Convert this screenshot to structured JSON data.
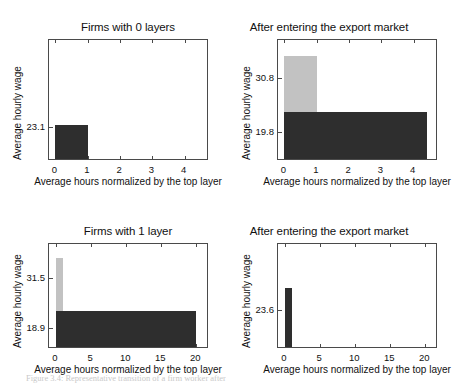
{
  "figure": {
    "caption": "Figure 3.4: Representative transition of a firm worker after"
  },
  "chart_data": [
    {
      "id": "firms-0-layers",
      "type": "bar",
      "title": "Firms with 0 layers",
      "xlabel": "Average hours normalized by the top layer",
      "ylabel": "Average hourly wage",
      "xlim": [
        -0.2,
        4.75
      ],
      "ylim": [
        17.0,
        38.5
      ],
      "xticks": [
        0,
        1,
        2,
        3,
        4
      ],
      "xticklabels": [
        "0",
        "1",
        "2",
        "3",
        "4"
      ],
      "yticks": [
        23.1
      ],
      "yticklabels": [
        "23.1"
      ],
      "grid": false,
      "legend": "none",
      "bars": [
        {
          "name": "layer-0",
          "x0": 0,
          "x1": 1,
          "value": 23.1,
          "color": "#2e2e2e"
        }
      ]
    },
    {
      "id": "firms-0-layers-after-export",
      "type": "bar",
      "title": "After entering the export market",
      "xlabel": "Average hours normalized by the top layer",
      "ylabel": "Average hourly wage",
      "xlim": [
        -0.2,
        4.75
      ],
      "ylim": [
        14.0,
        38.5
      ],
      "xticks": [
        0,
        1,
        2,
        3,
        4
      ],
      "xticklabels": [
        "0",
        "1",
        "2",
        "3",
        "4"
      ],
      "yticks": [
        19.8,
        30.8
      ],
      "yticklabels": [
        "19.8",
        "30.8"
      ],
      "grid": false,
      "legend": "none",
      "bars": [
        {
          "name": "layer-1-top",
          "x0": 0,
          "x1": 1,
          "value": 34.8,
          "color": "#c2c2c2"
        },
        {
          "name": "layer-0-base",
          "x0": 0,
          "x1": 4.4,
          "value": 23.6,
          "color": "#2e2e2e"
        }
      ]
    },
    {
      "id": "firms-1-layer",
      "type": "bar",
      "title": "Firms with 1 layer",
      "xlabel": "Average hours normalized by the top layer",
      "ylabel": "Average hourly wage",
      "xlim": [
        -1.0,
        21.8
      ],
      "ylim": [
        13.5,
        40.0
      ],
      "xticks": [
        0,
        5,
        10,
        15,
        20
      ],
      "xticklabels": [
        "0",
        "5",
        "10",
        "15",
        "20"
      ],
      "yticks": [
        18.9,
        31.5
      ],
      "yticklabels": [
        "18.9",
        "31.5"
      ],
      "grid": false,
      "legend": "none",
      "bars": [
        {
          "name": "layer-1-top",
          "x0": 0,
          "x1": 1,
          "value": 36.0,
          "color": "#c2c2c2"
        },
        {
          "name": "layer-0-base",
          "x0": 0,
          "x1": 20,
          "value": 22.5,
          "color": "#2e2e2e"
        }
      ]
    },
    {
      "id": "firms-1-layer-after-export",
      "type": "bar",
      "title": "After entering the export market",
      "xlabel": "Average hours normalized by the top layer",
      "ylabel": "Average hourly wage",
      "xlim": [
        -1.0,
        21.8
      ],
      "ylim": [
        14.0,
        40.0
      ],
      "xticks": [
        0,
        5,
        10,
        15,
        20
      ],
      "xticklabels": [
        "0",
        "5",
        "10",
        "15",
        "20"
      ],
      "yticks": [
        23.6
      ],
      "yticklabels": [
        "23.6"
      ],
      "grid": false,
      "legend": "none",
      "bars": [
        {
          "name": "layer-0",
          "x0": 0,
          "x1": 1,
          "value": 28.6,
          "color": "#2e2e2e"
        }
      ]
    }
  ],
  "colors": {
    "bar_dark": "#2e2e2e",
    "bar_light": "#c2c2c2",
    "axis": "#4a4a4a",
    "text": "#111111",
    "background": "#ffffff"
  }
}
